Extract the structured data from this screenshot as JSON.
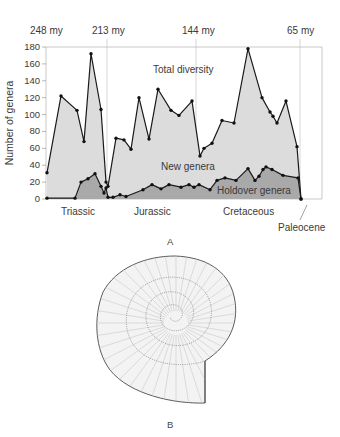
{
  "figure": {
    "panel_a_label": "A",
    "panel_b_label": "B"
  },
  "chart_data": {
    "type": "area",
    "title": "",
    "xlabel": "",
    "ylabel": "Number of genera",
    "ylim": [
      0,
      180
    ],
    "yticks": [
      0,
      20,
      40,
      60,
      80,
      100,
      120,
      140,
      160,
      180
    ],
    "grid": false,
    "time_markers": [
      {
        "label": "248 my",
        "x_px": 46
      },
      {
        "label": "213 my",
        "x_px": 107
      },
      {
        "label": "144 my",
        "x_px": 196
      },
      {
        "label": "65 my",
        "x_px": 300
      }
    ],
    "periods": [
      {
        "label": "Triassic"
      },
      {
        "label": "Jurassic"
      },
      {
        "label": "Cretaceous"
      },
      {
        "label": "Paleocene"
      }
    ],
    "annotations": [
      "Total diversity",
      "New genera",
      "Holdover genera"
    ],
    "series": [
      {
        "name": "Total diversity",
        "points_px_x": [
          47,
          61,
          77,
          84,
          91,
          101,
          106,
          108,
          116,
          124,
          131,
          139,
          149,
          158,
          171,
          179,
          192,
          200,
          204,
          212,
          222,
          234,
          248,
          262,
          270,
          273,
          277,
          286,
          297,
          301
        ],
        "values": [
          31,
          122,
          105,
          68,
          172,
          106,
          20,
          15,
          72,
          70,
          59,
          120,
          71,
          130,
          105,
          99,
          116,
          51,
          60,
          66,
          93,
          90,
          178,
          120,
          103,
          98,
          90,
          116,
          62,
          0
        ]
      },
      {
        "name": "Holdover genera",
        "points_px_x": [
          47,
          75,
          81,
          88,
          95,
          101,
          104,
          106,
          108,
          113,
          120,
          126,
          143,
          152,
          161,
          169,
          181,
          189,
          194,
          199,
          210,
          217,
          225,
          236,
          248,
          255,
          259,
          263,
          266,
          272,
          283,
          298,
          301
        ],
        "values": [
          1,
          1,
          20,
          24,
          30,
          15,
          7,
          13,
          2,
          2,
          5,
          3,
          11,
          17,
          12,
          17,
          14,
          17,
          14,
          17,
          11,
          22,
          25,
          22,
          36,
          22,
          27,
          35,
          38,
          35,
          28,
          25,
          0
        ]
      }
    ]
  }
}
